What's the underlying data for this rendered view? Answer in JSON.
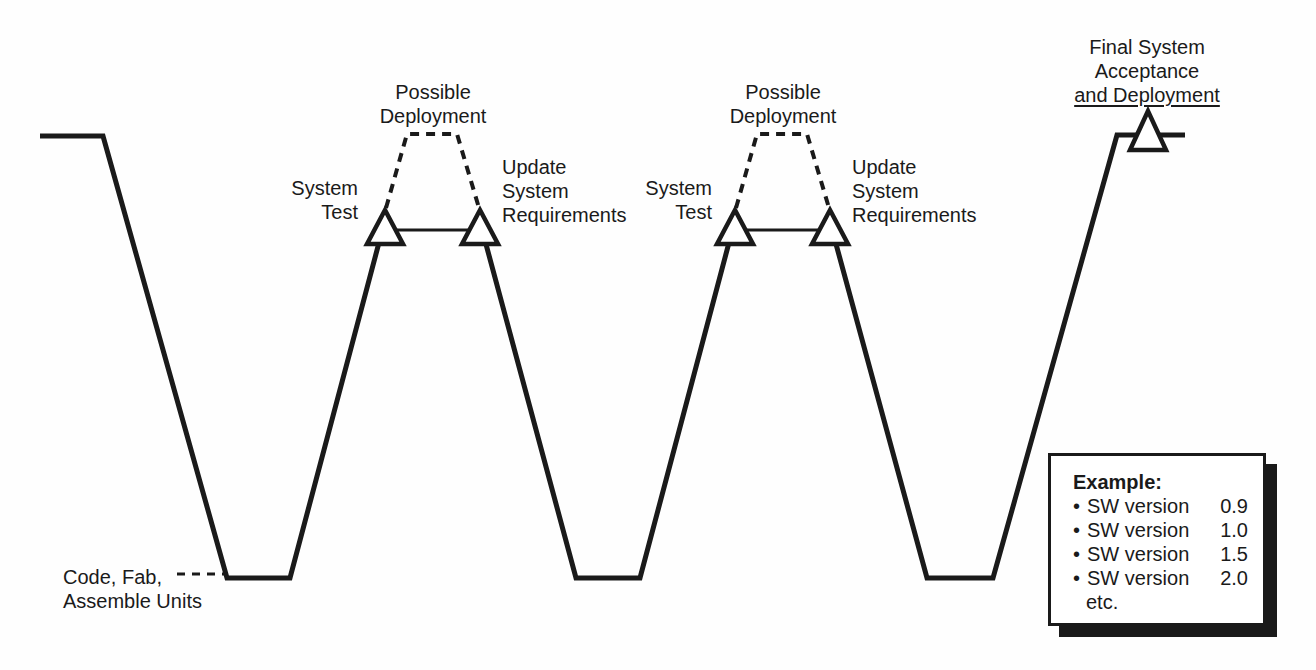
{
  "colors": {
    "ink": "#1a1a1a",
    "paper": "#ffffff",
    "triangle_fill": "#ffffff"
  },
  "labels": {
    "code_fab": {
      "line1": "Code, Fab,",
      "line2": "Assemble Units"
    },
    "iteration1": {
      "system_test": {
        "line1": "System",
        "line2": "Test"
      },
      "possible_deployment": {
        "line1": "Possible",
        "line2": "Deployment"
      },
      "update_requirements": {
        "line1": "Update",
        "line2": "System",
        "line3": "Requirements"
      }
    },
    "iteration2": {
      "system_test": {
        "line1": "System",
        "line2": "Test"
      },
      "possible_deployment": {
        "line1": "Possible",
        "line2": "Deployment"
      },
      "update_requirements": {
        "line1": "Update",
        "line2": "System",
        "line3": "Requirements"
      }
    },
    "final_acceptance": {
      "line1": "Final System",
      "line2": "Acceptance",
      "line3": "and Deployment"
    }
  },
  "legend": {
    "title": "Example:",
    "bullet": "•",
    "items": [
      {
        "label": "SW version",
        "value": "0.9"
      },
      {
        "label": "SW version",
        "value": "1.0"
      },
      {
        "label": "SW version",
        "value": "1.5"
      },
      {
        "label": "SW version",
        "value": "2.0"
      }
    ],
    "footer": "etc."
  }
}
